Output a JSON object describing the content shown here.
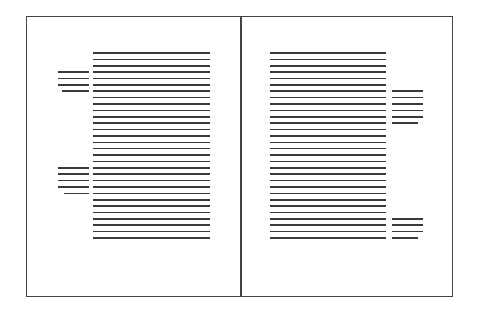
{
  "diagram": {
    "type": "two-page-spread-layout",
    "line_color": "#3a3a3a",
    "frame_color": "#444444",
    "line_spacing": 6.38,
    "first_line_y": 53,
    "pages": [
      {
        "name": "left-page",
        "main_column": {
          "x_start": 93,
          "x_end": 210,
          "line_count": 30
        },
        "side_notes": [
          {
            "x_start": 58,
            "x_end": 89,
            "start_line": 3,
            "line_count": 4,
            "last_line_x_start": 62
          },
          {
            "x_start": 58,
            "x_end": 89,
            "start_line": 18,
            "line_count": 5,
            "last_line_x_start": 64
          }
        ]
      },
      {
        "name": "right-page",
        "main_column": {
          "x_start": 270,
          "x_end": 386,
          "line_count": 30
        },
        "side_notes": [
          {
            "x_start": 392,
            "x_end": 423,
            "start_line": 6,
            "line_count": 6,
            "last_line_x_end": 418
          },
          {
            "x_start": 392,
            "x_end": 423,
            "start_line": 26,
            "line_count": 4,
            "last_line_x_end": 418
          }
        ]
      }
    ]
  }
}
